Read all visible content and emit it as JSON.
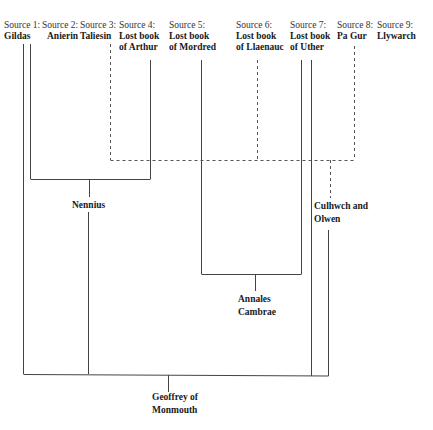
{
  "sources": [
    {
      "id": "s1",
      "head": "Source 1:",
      "name_lines": [
        "Gildas"
      ],
      "x": 20
    },
    {
      "id": "s2",
      "head": "Source 2:",
      "name_lines": [
        "Anierin"
      ],
      "x": 58
    },
    {
      "id": "s3",
      "head": "Source 3:",
      "name_lines": [
        "Taliesin"
      ],
      "x": 97
    },
    {
      "id": "s4",
      "head": "Source 4:",
      "name_lines": [
        "Lost book",
        "of Arthur"
      ],
      "x": 135
    },
    {
      "id": "s5",
      "head": "Source 5:",
      "name_lines": [
        "Lost book",
        "of Mordred"
      ],
      "x": 184
    },
    {
      "id": "s6",
      "head": "Source 6:",
      "name_lines": [
        "Lost book",
        "of Llaenauc"
      ],
      "x": 236
    },
    {
      "id": "s7",
      "head": "Source 7:",
      "name_lines": [
        "Lost book",
        "of Uther"
      ],
      "x": 290
    },
    {
      "id": "s8",
      "head": "Source 8:",
      "name_lines": [
        "Pa Gur"
      ],
      "x": 337
    },
    {
      "id": "s9",
      "head": "Source 9:",
      "name_lines": [
        "Llywarch"
      ],
      "x": 377
    }
  ],
  "nodes": {
    "nennius": {
      "lines": [
        "Nennius"
      ]
    },
    "culhwch": {
      "lines": [
        "Culhwch and",
        "Olwen"
      ]
    },
    "annales": {
      "lines": [
        "Annales",
        "Cambrae"
      ]
    },
    "geoffrey": {
      "lines": [
        "Geoffrey of",
        "Monmouth"
      ]
    }
  },
  "line_color": "#444444"
}
